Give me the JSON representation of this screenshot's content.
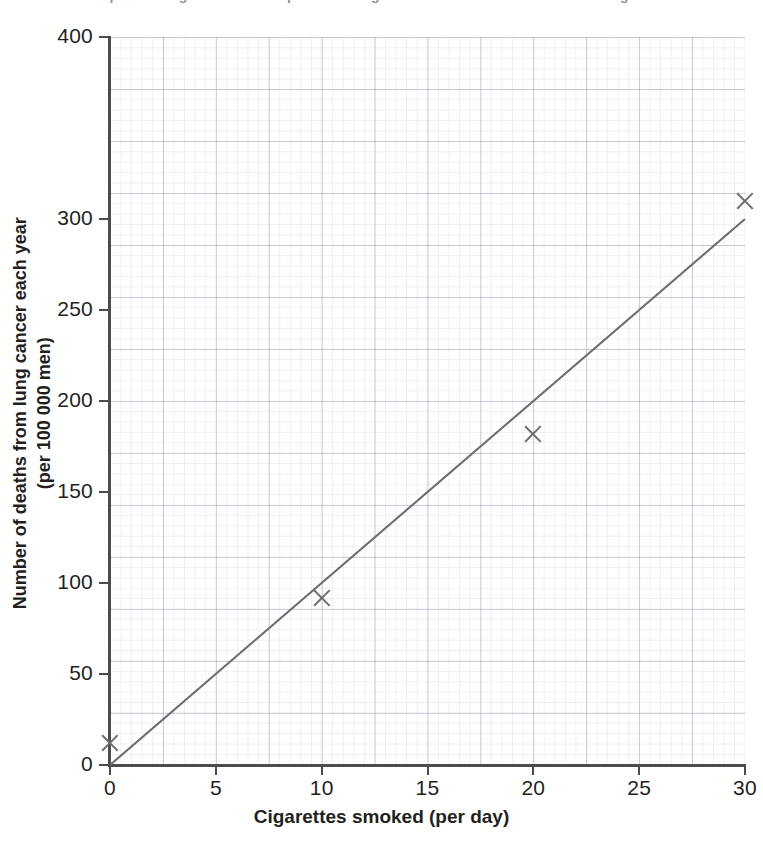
{
  "title": "Graph showing the relationship between cigarettes smoked and deaths from lung cancer",
  "chart_data": {
    "type": "scatter",
    "title": "",
    "xlabel": "Cigarettes smoked (per day)",
    "ylabel": "Number of deaths from lung cancer each year (per 100 000 men)",
    "ylabel_line1": "Number of deaths from lung cancer each year",
    "ylabel_line2": "(per 100 000 men)",
    "xlim": [
      0,
      30
    ],
    "ylim": [
      0,
      400
    ],
    "grid": true,
    "grid_style": "graph-paper",
    "legend": "none",
    "x_ticks": [
      0,
      5,
      10,
      15,
      20,
      25,
      30
    ],
    "x_tick_labels": [
      "0",
      "5",
      "10",
      "15",
      "20",
      "25",
      "30"
    ],
    "y_ticks": [
      0,
      50,
      100,
      150,
      200,
      250,
      300,
      400
    ],
    "y_tick_labels": [
      "0",
      "50",
      "100",
      "150",
      "200",
      "250",
      "300",
      "400"
    ],
    "marker": "x",
    "marker_color": "#6e6e6e",
    "axis_color": "#4c4c4c",
    "x": [
      0,
      10,
      20,
      30
    ],
    "y": [
      12,
      92,
      182,
      310
    ],
    "points": [
      {
        "x": 0,
        "y": 12
      },
      {
        "x": 10,
        "y": 92
      },
      {
        "x": 20,
        "y": 182
      },
      {
        "x": 30,
        "y": 310
      }
    ],
    "series": [
      {
        "name": "Deaths from lung cancer",
        "values": [
          12,
          92,
          182,
          310
        ]
      }
    ],
    "trend_line": {
      "name": "line of best fit",
      "from": {
        "x": 0,
        "y": 0
      },
      "to": {
        "x": 30,
        "y": 300
      },
      "slope": 10,
      "intercept": 0,
      "color": "#6e6e6e"
    }
  }
}
